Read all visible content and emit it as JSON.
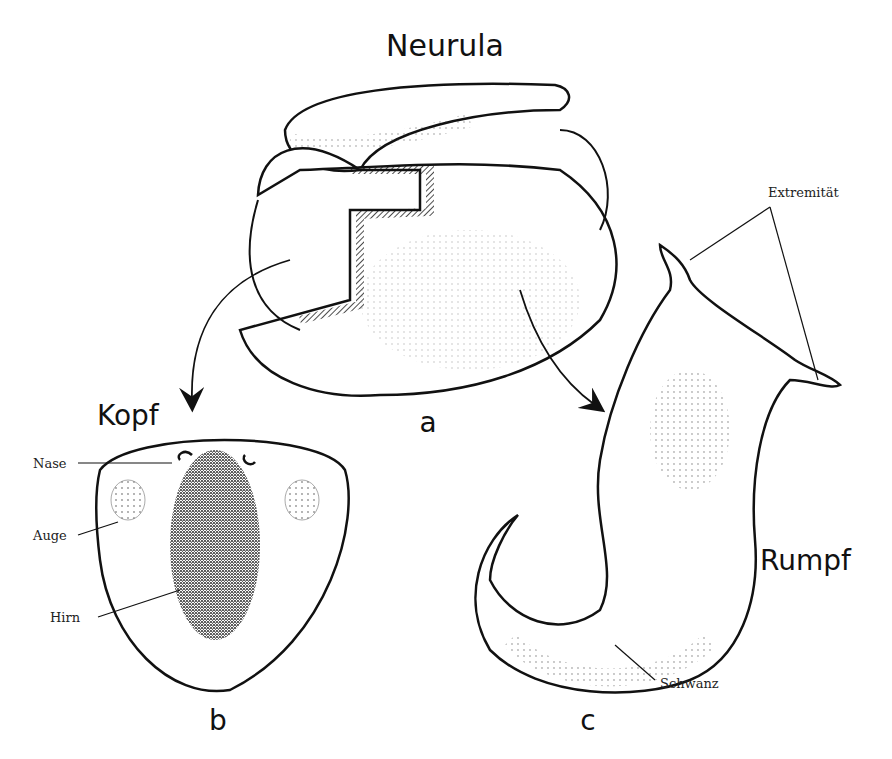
{
  "figure": {
    "title": "Neurula",
    "panels": [
      {
        "letter": "a",
        "title": "Neurula"
      },
      {
        "letter": "b",
        "title": "Kopf"
      },
      {
        "letter": "c",
        "title": "Rumpf"
      }
    ],
    "labels": {
      "nase": "Nase",
      "auge": "Auge",
      "hirn": "Hirn",
      "extremitaet": "Extremität",
      "schwanz": "Schwanz"
    }
  }
}
